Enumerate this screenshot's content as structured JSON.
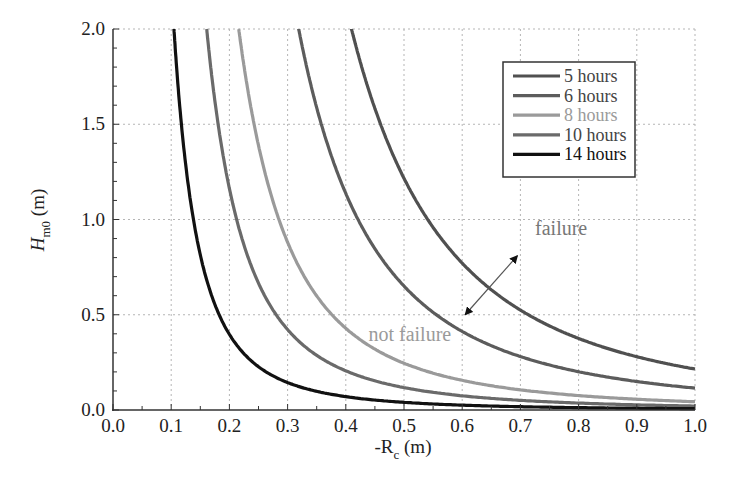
{
  "chart_data": {
    "type": "line",
    "title": "",
    "xlabel": "-R_c (m)",
    "xlabel_main": "-R",
    "xlabel_sub": "c",
    "xlabel_unit": " (m)",
    "ylabel_main": "H",
    "ylabel_sub": "m0",
    "ylabel_unit": " (m)",
    "xlim": [
      0.0,
      1.0
    ],
    "ylim": [
      0.0,
      2.0
    ],
    "xticks": [
      "0.0",
      "0.1",
      "0.2",
      "0.3",
      "0.4",
      "0.5",
      "0.6",
      "0.7",
      "0.8",
      "0.9",
      "1.0"
    ],
    "yticks": [
      "0.0",
      "0.5",
      "1.0",
      "1.5",
      "2.0"
    ],
    "grid": true,
    "legend_position": "upper right",
    "model": "H = c / x^2.5 (fitted to visible curves)",
    "series": [
      {
        "name": "5 hours",
        "color": "#505050",
        "c": 0.215,
        "x_at_top": 0.41,
        "y_at_x1": 0.215
      },
      {
        "name": "6 hours",
        "color": "#5c5c5c",
        "c": 0.115,
        "x_at_top": 0.319,
        "y_at_x1": 0.12
      },
      {
        "name": "8 hours",
        "color": "#9a9a9a",
        "c": 0.0434,
        "x_at_top": 0.216,
        "y_at_x1": 0.045
      },
      {
        "name": "10 hours",
        "color": "#6a6a6a",
        "c": 0.0208,
        "x_at_top": 0.161,
        "y_at_x1": 0.025
      },
      {
        "name": "14 hours",
        "color": "#111111",
        "c": 0.0071,
        "x_at_top": 0.105,
        "y_at_x1": 0.01
      }
    ],
    "annotations": [
      {
        "text": "failure",
        "x": 0.77,
        "y": 0.92,
        "color": "#777777"
      },
      {
        "text": "not failure",
        "x": 0.51,
        "y": 0.36,
        "color": "#9a9a9a"
      }
    ],
    "arrow": {
      "from": [
        0.605,
        0.5
      ],
      "to": [
        0.695,
        0.81
      ]
    }
  }
}
